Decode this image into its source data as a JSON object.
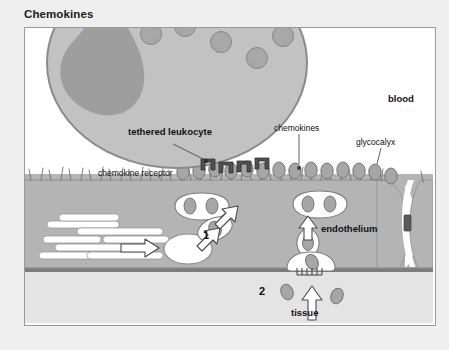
{
  "figure": {
    "title": "Chemokines",
    "background_color": "#efefef",
    "panel_background": "#ffffff",
    "border_color": "#9a9a9a"
  },
  "palette": {
    "blood_white": "#ffffff",
    "leukocyte_fill": "#c2c2c2",
    "leukocyte_edge": "#8a8a8a",
    "nucleus_fill": "#9e9e9e",
    "granule_fill": "#a8a8a8",
    "granule_edge": "#858585",
    "endothelium_fill": "#b4b4b4",
    "endothelium_edge": "#8f8f8f",
    "basal_lamina": "#7d7d7d",
    "tissue_fill": "#e4e4e4",
    "chemokine_fill": "#a6a6a6",
    "chemokine_edge": "#6f6f6f",
    "receptor_fill": "#5a5a5a",
    "vesicle_fill": "#ffffff",
    "arrow_fill": "#ffffff",
    "arrow_edge": "#4a4a4a",
    "text_color": "#111111"
  },
  "labels": {
    "tethered_leukocyte": "tethered leukocyte",
    "chemokine_receptor": "chemokine receptor",
    "chemokines": "chemokines",
    "glycocalyx": "glycocalyx",
    "blood": "blood",
    "endothelium": "endothelium",
    "tissue": "tissue",
    "step_one": "1",
    "step_two": "2"
  },
  "label_positions": {
    "tethered_leukocyte": {
      "x": 103,
      "y": 104,
      "bold": true,
      "size": 9.5
    },
    "chemokine_receptor": {
      "x": 73,
      "y": 146,
      "bold": false,
      "size": 8.5
    },
    "chemokines": {
      "x": 261,
      "y": 129,
      "bold": false,
      "size": 8.5
    },
    "glycocalyx": {
      "x": 351,
      "y": 140,
      "bold": false,
      "size": 8.5
    },
    "blood": {
      "x": 387,
      "y": 97,
      "bold": true,
      "size": 9.5
    },
    "endothelium": {
      "x": 318,
      "y": 225,
      "bold": true,
      "size": 9.5
    },
    "tissue": {
      "x": 286,
      "y": 314,
      "bold": true,
      "size": 9.5
    },
    "step_one": {
      "x": 199,
      "y": 231,
      "bold": true,
      "size": 11
    },
    "step_two": {
      "x": 254,
      "y": 294,
      "bold": true,
      "size": 11
    }
  },
  "diagram": {
    "type": "biological-schematic",
    "topic": "chemokine transcytosis and presentation on endothelium",
    "layers": [
      {
        "name": "blood",
        "y_top": 0,
        "y_bottom": 146,
        "fill": "#ffffff"
      },
      {
        "name": "endothelium",
        "y_top": 146,
        "y_bottom": 242,
        "fill": "#b4b4b4"
      },
      {
        "name": "basal-lamina",
        "y_top": 242,
        "y_bottom": 246,
        "fill": "#7d7d7d"
      },
      {
        "name": "tissue",
        "y_top": 246,
        "y_bottom": 295,
        "fill": "#e4e4e4"
      }
    ],
    "leukocyte": {
      "center_x": 152,
      "center_y": 35,
      "radius_x": 130,
      "radius_y": 105,
      "granule_count": 13,
      "has_lobed_nucleus": true
    },
    "receptors": {
      "count": 4,
      "x_positions": [
        189,
        203,
        217,
        231
      ],
      "y": 122,
      "description": "chemokine receptors on tethered leukocyte surface"
    },
    "surface_chemokines": {
      "count": 14,
      "description": "chemokines bound to glycocalyx on luminal endothelial surface"
    },
    "glycocalyx_hairs": {
      "count": 34,
      "description": "fine projections along luminal endothelial surface"
    },
    "transcytosis_vesicles": [
      {
        "label": "basal-uptake",
        "x": 140,
        "y": 215,
        "note": "vesicle forming at basal side"
      },
      {
        "label": "transport-1",
        "x": 188,
        "y": 198,
        "note": "vesicle carrying chemokine upward"
      },
      {
        "label": "transport-2",
        "x": 175,
        "y": 185,
        "note": "double vesicle near apical surface"
      },
      {
        "label": "transport-3",
        "x": 289,
        "y": 207,
        "note": "vesicle in right cell"
      },
      {
        "label": "transport-4",
        "x": 295,
        "y": 190,
        "note": "vesicle near apical surface right cell"
      },
      {
        "label": "basal-fusion",
        "x": 283,
        "y": 236,
        "note": "vesicle fusing with basal membrane"
      }
    ],
    "arrows": [
      {
        "name": "flow-arrow",
        "x": 110,
        "y": 216,
        "direction": "right"
      },
      {
        "name": "transcytosis-arrow-left",
        "x": 170,
        "y": 205,
        "direction": "up-right"
      },
      {
        "name": "transcytosis-arrow-mid",
        "x": 192,
        "y": 182,
        "direction": "up-right"
      },
      {
        "name": "transcytosis-arrow-right",
        "x": 285,
        "y": 200,
        "direction": "up"
      },
      {
        "name": "tissue-arrow",
        "x": 290,
        "y": 290,
        "direction": "up"
      }
    ],
    "junction": {
      "x": 400,
      "y_top": 190,
      "y_bottom": 215,
      "description": "interendothelial junction between adjacent endothelial cells"
    },
    "steps": {
      "1": "chemokine uptake and transcytosis within endothelial cell",
      "2": "chemokine release from tissue side / production in tissue"
    }
  }
}
